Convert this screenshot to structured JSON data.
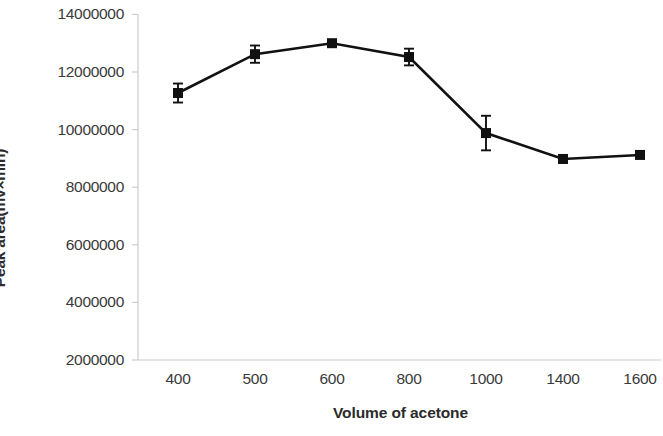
{
  "chart_data": {
    "type": "line",
    "title": "",
    "xlabel": "Volume of acetone",
    "ylabel": "Peak area(mv×min)",
    "categories": [
      "400",
      "500",
      "600",
      "800",
      "1000",
      "1400",
      "1600"
    ],
    "values": [
      11270000,
      12620000,
      13000000,
      12520000,
      9880000,
      8980000,
      9120000
    ],
    "errors": [
      330000,
      300000,
      110000,
      290000,
      600000,
      110000,
      110000
    ],
    "ylim": [
      2000000,
      14000000
    ],
    "ytick_labels": [
      "2000000",
      "4000000",
      "6000000",
      "8000000",
      "10000000",
      "12000000",
      "14000000"
    ],
    "ytick_values": [
      2000000,
      4000000,
      6000000,
      8000000,
      10000000,
      12000000,
      14000000
    ],
    "grid": false,
    "legend": "none",
    "marker": "square",
    "series_color": "#111111",
    "axis_color": "#c9c9c9",
    "background": "#ffffff"
  }
}
